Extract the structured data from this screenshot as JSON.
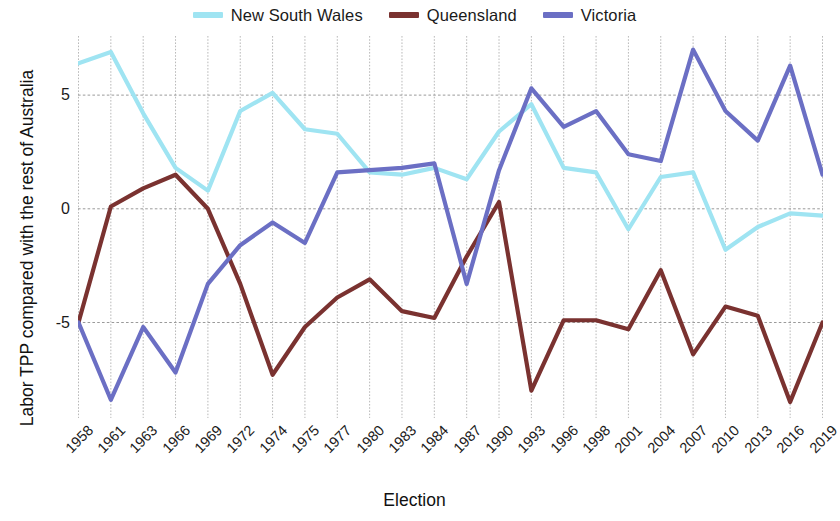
{
  "chart_data": {
    "type": "line",
    "title": "",
    "xlabel": "Election",
    "ylabel": "Labor TPP compared with the rest of Australia",
    "categories": [
      "1958",
      "1961",
      "1963",
      "1966",
      "1969",
      "1972",
      "1974",
      "1975",
      "1977",
      "1980",
      "1983",
      "1984",
      "1987",
      "1990",
      "1993",
      "1996",
      "1998",
      "2001",
      "2004",
      "2007",
      "2010",
      "2013",
      "2016",
      "2019"
    ],
    "ylim": [
      -9.2,
      7.6
    ],
    "yticks": [
      5,
      0,
      -5
    ],
    "ytick_labels": [
      "5",
      "0",
      "-5"
    ],
    "grid": true,
    "legend_position": "top-center",
    "series": [
      {
        "name": "New South Wales",
        "color": "#9fe4f2",
        "values": [
          6.4,
          6.9,
          4.2,
          1.8,
          0.8,
          4.3,
          5.1,
          3.5,
          3.3,
          1.6,
          1.5,
          1.8,
          1.3,
          3.4,
          4.6,
          1.8,
          1.6,
          -0.9,
          1.4,
          1.6,
          -1.8,
          -0.8,
          -0.2,
          -0.3
        ]
      },
      {
        "name": "Queensland",
        "color": "#7a3230",
        "values": [
          -5.0,
          0.1,
          0.9,
          1.5,
          0.0,
          -3.3,
          -7.3,
          -5.2,
          -3.9,
          -3.1,
          -4.5,
          -4.8,
          -2.1,
          0.3,
          -8.0,
          -4.9,
          -4.9,
          -5.3,
          -2.7,
          -6.4,
          -4.3,
          -4.7,
          -8.5,
          -5.0
        ]
      },
      {
        "name": "Victoria",
        "color": "#6b6fc4",
        "values": [
          -5.0,
          -8.4,
          -5.2,
          -7.2,
          -3.3,
          -1.6,
          -0.6,
          -1.5,
          1.6,
          1.7,
          1.8,
          2.0,
          -3.3,
          1.7,
          5.3,
          3.6,
          4.3,
          2.4,
          2.1,
          7.0,
          4.3,
          3.0,
          6.3,
          1.5
        ]
      }
    ]
  },
  "legend": {
    "entries": [
      {
        "label": "New South Wales",
        "color": "#9fe4f2"
      },
      {
        "label": "Queensland",
        "color": "#7a3230"
      },
      {
        "label": "Victoria",
        "color": "#6b6fc4"
      }
    ]
  },
  "axes": {
    "x_title": "Election",
    "y_title": "Labor TPP compared with the rest of Australia"
  }
}
